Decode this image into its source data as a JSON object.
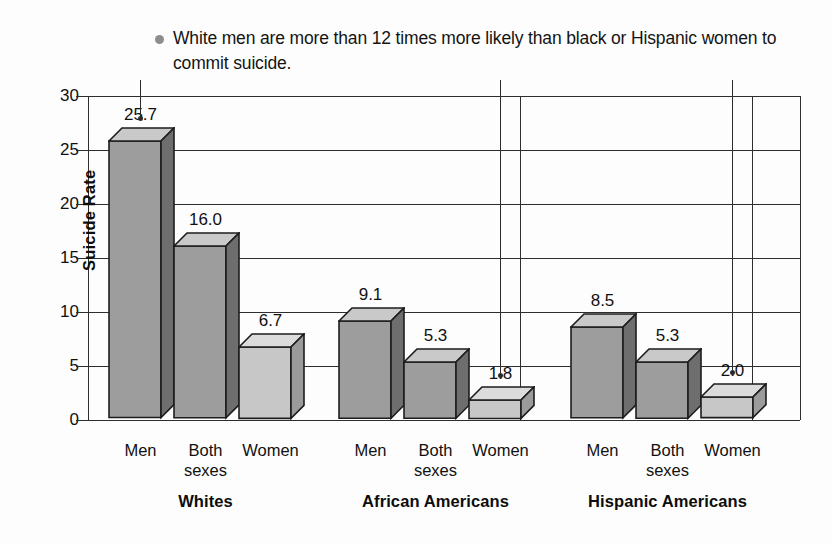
{
  "caption": {
    "bullet": "round-bullet",
    "text": "White men are more than 12 times more likely than black or Hispanic women to commit suicide."
  },
  "chart_data": {
    "type": "bar",
    "title": "",
    "xlabel": "",
    "ylabel": "Suicide Rate",
    "ylim": [
      0,
      30
    ],
    "yticks": [
      0,
      5,
      10,
      15,
      20,
      25,
      30
    ],
    "ytick_labels": [
      "0",
      "5",
      "10",
      "15",
      "20",
      "25",
      "30"
    ],
    "grid": true,
    "legend": "none",
    "categories": [
      "Men",
      "Both sexes",
      "Women"
    ],
    "groups": [
      "Whites",
      "African Americans",
      "Hispanic Americans"
    ],
    "series": [
      {
        "name": "Whites",
        "values": [
          25.7,
          16.0,
          6.7
        ],
        "labels": [
          "25.7",
          "16.0",
          "6.7"
        ]
      },
      {
        "name": "African Americans",
        "values": [
          9.1,
          5.3,
          1.8
        ],
        "labels": [
          "9.1",
          "5.3",
          "1.8"
        ]
      },
      {
        "name": "Hispanic Americans",
        "values": [
          8.5,
          5.3,
          2.0
        ],
        "labels": [
          "8.5",
          "5.3",
          "2.0"
        ]
      }
    ],
    "annotations": [
      {
        "target": "Whites / Men",
        "value": "25.7"
      },
      {
        "target": "African Americans / Women",
        "value": "1.8"
      },
      {
        "target": "Hispanic Americans / Women",
        "value": "2.0"
      }
    ],
    "colors": {
      "bar_front_dark": "#9d9d9d",
      "bar_front_light": "#c7c7c7",
      "bar_top_dark": "#c9c9c9",
      "bar_top_light": "#dcdcdc",
      "bar_side_dark": "#6e6e6e",
      "bar_side_light": "#9b9b9b",
      "outline": "#1d1d1d",
      "axis": "#2e2e2e",
      "background": "#fdfdfd"
    }
  },
  "xlabels": {
    "men": "Men",
    "both_line1": "Both",
    "both_line2": "sexes",
    "women": "Women"
  }
}
